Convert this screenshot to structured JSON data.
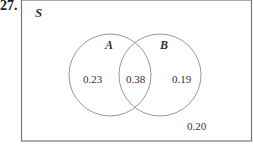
{
  "problem_number": "27.",
  "diagram": {
    "universal_label": "S",
    "sets": [
      {
        "label": "A",
        "only_value": "0.23"
      },
      {
        "label": "B",
        "only_value": "0.19"
      }
    ],
    "intersection_value": "0.38",
    "outside_value": "0.20"
  }
}
